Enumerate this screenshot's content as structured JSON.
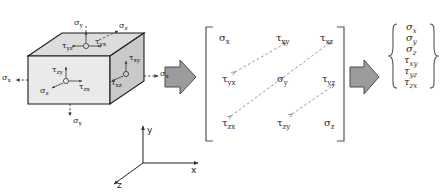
{
  "figure": {
    "background_color": "#ffffff",
    "ink_color": "#222222",
    "arrow_fill": "#9a9a9a",
    "arrow_stroke": "#4a4a4a",
    "face_front_fill": "#e8e8e8",
    "face_right_fill": "#c8c8c8",
    "face_top_fill": "#dcdcdc"
  },
  "element": {
    "name": "stress-cube",
    "labels": {
      "sigma_x_left": "σx",
      "sigma_x_right": "σx",
      "sigma_y_top": "σy",
      "sigma_y_bottom": "σy",
      "sigma_z_top": "σz",
      "sigma_z_front": "σz",
      "tau_yz": "τyz",
      "tau_yx": "τyx",
      "tau_zy": "τzy",
      "tau_zx": "τzx",
      "tau_xy": "τxy",
      "tau_xz": "τxz"
    },
    "label_parts": {
      "sigma_x_left": {
        "sym": "σ",
        "sub": "x"
      },
      "sigma_x_right": {
        "sym": "σ",
        "sub": "x"
      },
      "sigma_y_top": {
        "sym": "σ",
        "sub": "y"
      },
      "sigma_y_bottom": {
        "sym": "σ",
        "sub": "y"
      },
      "sigma_z_top": {
        "sym": "σ",
        "sub": "z"
      },
      "sigma_z_front": {
        "sym": "σ",
        "sub": "z"
      },
      "tau_yz": {
        "sym": "τ",
        "sub": "yz"
      },
      "tau_yx": {
        "sym": "τ",
        "sub": "yx"
      },
      "tau_zy": {
        "sym": "τ",
        "sub": "zy"
      },
      "tau_zx": {
        "sym": "τ",
        "sub": "zx"
      },
      "tau_xy": {
        "sym": "τ",
        "sub": "xy"
      },
      "tau_xz": {
        "sym": "τ",
        "sub": "xz"
      }
    }
  },
  "axes": {
    "name": "coordinate-triad",
    "x": "x",
    "y": "y",
    "z": "z"
  },
  "flow": {
    "arrow_1": "block-arrow-right",
    "arrow_2": "block-arrow-right"
  },
  "matrix": {
    "name": "stress-tensor-matrix",
    "bracket": "square",
    "rows": [
      [
        {
          "sym": "σ",
          "sub": "x"
        },
        {
          "sym": "τ",
          "sub": "xy"
        },
        {
          "sym": "τ",
          "sub": "xz"
        }
      ],
      [
        {
          "sym": "τ",
          "sub": "yx"
        },
        {
          "sym": "σ",
          "sub": "y"
        },
        {
          "sym": "τ",
          "sub": "yz"
        }
      ],
      [
        {
          "sym": "τ",
          "sub": "zx"
        },
        {
          "sym": "τ",
          "sub": "zy"
        },
        {
          "sym": "σ",
          "sub": "z"
        }
      ]
    ],
    "symmetry_arrows": [
      {
        "from": "tau-yx",
        "to": "tau-xy",
        "style": "dashed-double"
      },
      {
        "from": "tau-zx",
        "to": "tau-xz",
        "style": "dashed-double"
      },
      {
        "from": "tau-zy",
        "to": "tau-yz",
        "style": "dashed-double"
      }
    ]
  },
  "vector": {
    "name": "stress-vector",
    "bracket": "curly",
    "items": [
      {
        "sym": "σ",
        "sub": "x"
      },
      {
        "sym": "σ",
        "sub": "y"
      },
      {
        "sym": "σ",
        "sub": "z"
      },
      {
        "sym": "τ",
        "sub": "xy"
      },
      {
        "sym": "τ",
        "sub": "yz"
      },
      {
        "sym": "τ",
        "sub": "zx"
      }
    ]
  }
}
